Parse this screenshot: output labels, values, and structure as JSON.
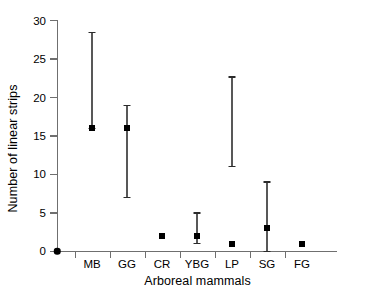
{
  "chart_data": {
    "type": "scatter",
    "title": "",
    "xlabel": "Arboreal mammals",
    "ylabel": "Number of linear strips",
    "categories": [
      "MB",
      "GG",
      "CR",
      "YBG",
      "LP",
      "SG",
      "FG"
    ],
    "values": [
      16,
      16,
      2,
      2,
      1,
      3,
      1
    ],
    "error_low": [
      16,
      7,
      null,
      1,
      11,
      0,
      null
    ],
    "error_high": [
      28.5,
      19,
      null,
      5,
      22.7,
      9,
      null
    ],
    "ylim": [
      0,
      30
    ],
    "yticks": [
      0,
      5,
      10,
      15,
      20,
      25,
      30
    ],
    "ytick_labels": [
      "0",
      "5",
      "10",
      "15",
      "20",
      "25",
      "30"
    ],
    "grid": false,
    "legend": false,
    "series": [
      {
        "name": "Number of linear strips",
        "points": [
          {
            "category": "MB",
            "value": 16,
            "lower": 16,
            "upper": 28.5
          },
          {
            "category": "GG",
            "value": 16,
            "lower": 7,
            "upper": 19
          },
          {
            "category": "CR",
            "value": 2,
            "lower": null,
            "upper": null
          },
          {
            "category": "YBG",
            "value": 2,
            "lower": 1,
            "upper": 5
          },
          {
            "category": "LP",
            "value": 1,
            "lower": 11,
            "upper": 22.7
          },
          {
            "category": "SG",
            "value": 3,
            "lower": 0,
            "upper": 9
          },
          {
            "category": "FG",
            "value": 1,
            "lower": null,
            "upper": null
          }
        ]
      }
    ],
    "origin_point": {
      "x": 0,
      "y": 0
    },
    "marker_color": "#000000",
    "errorbar_color": "#585858",
    "axis_color": "#6f6f6f",
    "background_color": "#ffffff"
  }
}
